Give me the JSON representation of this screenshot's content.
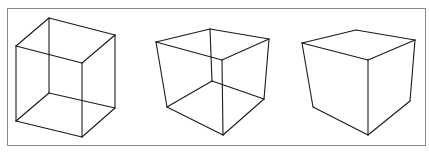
{
  "figure": {
    "frame": {
      "x": 7.5,
      "y": 8.5,
      "w": 418,
      "h": 137,
      "color": "#8a8a8a"
    },
    "line_color": "#1a1a1a",
    "cubes": [
      {
        "name": "necker-cube-wireframe",
        "edges": [
          [
            49,
            18,
            16,
            46
          ],
          [
            49,
            18,
            115,
            35
          ],
          [
            16,
            46,
            82,
            63
          ],
          [
            115,
            35,
            82,
            63
          ],
          [
            16,
            121,
            82,
            137
          ],
          [
            82,
            137,
            115,
            108
          ],
          [
            115,
            108,
            49,
            93
          ],
          [
            49,
            93,
            16,
            121
          ],
          [
            16,
            46,
            16,
            121
          ],
          [
            49,
            18,
            49,
            93
          ],
          [
            115,
            35,
            115,
            108
          ],
          [
            82,
            63,
            82,
            137
          ]
        ]
      },
      {
        "name": "perspective-cube-wireframe",
        "edges": [
          [
            210,
            29,
            156,
            42
          ],
          [
            210,
            29,
            269,
            39
          ],
          [
            156,
            42,
            222,
            60
          ],
          [
            269,
            39,
            222,
            60
          ],
          [
            167,
            107,
            223,
            135
          ],
          [
            223,
            135,
            264,
            99
          ],
          [
            264,
            99,
            212,
            81
          ],
          [
            212,
            81,
            167,
            107
          ],
          [
            156,
            42,
            167,
            107
          ],
          [
            210,
            29,
            212,
            81
          ],
          [
            269,
            39,
            264,
            99
          ],
          [
            222,
            60,
            223,
            135
          ]
        ]
      },
      {
        "name": "solid-cube",
        "edges": [
          [
            356,
            30,
            302,
            43
          ],
          [
            356,
            30,
            415,
            40
          ],
          [
            302,
            43,
            368,
            60
          ],
          [
            415,
            40,
            368,
            60
          ],
          [
            302,
            43,
            313,
            107
          ],
          [
            313,
            107,
            368,
            135
          ],
          [
            368,
            135,
            410,
            101
          ],
          [
            410,
            101,
            415,
            40
          ],
          [
            368,
            60,
            368,
            135
          ]
        ]
      }
    ]
  }
}
